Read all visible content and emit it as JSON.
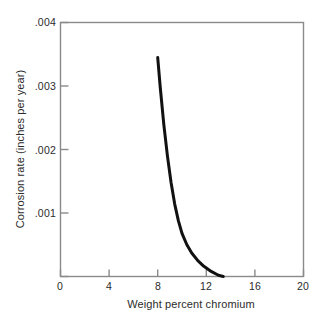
{
  "chart_data": {
    "type": "line",
    "title": "",
    "xlabel": "Weight percent chromium",
    "ylabel": "Corrosion rate (inches per year)",
    "xlim": [
      0,
      20
    ],
    "ylim": [
      0,
      0.004
    ],
    "xticks": [
      0,
      4,
      8,
      12,
      16,
      20
    ],
    "xticklabels": [
      "0",
      "4",
      "8",
      "12",
      "16",
      "20"
    ],
    "yticks": [
      0.001,
      0.002,
      0.003,
      0.004
    ],
    "yticklabels": [
      ".001",
      ".002",
      ".003",
      ".004"
    ],
    "grid": false,
    "legend": null,
    "series": [
      {
        "name": "corrosion rate",
        "color": "#111111",
        "linewidth": 3,
        "x": [
          8.0,
          8.2,
          8.5,
          8.8,
          9.1,
          9.4,
          9.7,
          10.0,
          10.4,
          10.8,
          11.3,
          11.8,
          12.4,
          13.0,
          13.4
        ],
        "y": [
          0.00345,
          0.003,
          0.0024,
          0.0019,
          0.00148,
          0.00114,
          0.00088,
          0.00068,
          0.0005,
          0.00037,
          0.00025,
          0.00016,
          8e-05,
          2e-05,
          0.0
        ]
      }
    ],
    "annotations": []
  },
  "axes": {
    "frame_color": "#8a8a8a",
    "tick_color": "#8a8a8a"
  }
}
